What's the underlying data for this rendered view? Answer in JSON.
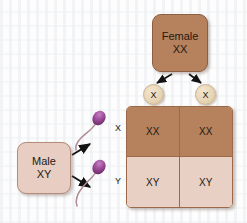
{
  "diagram": {
    "background_color": "#fdfdfd"
  },
  "female_parent": {
    "name": "Female parent box",
    "label": "Female",
    "genotype": "XX",
    "color": "#b6815d"
  },
  "male_parent": {
    "name": "Male parent box",
    "label": "Male",
    "genotype": "XY",
    "color": "#e7cdc2"
  },
  "female_gametes": [
    {
      "label": "X",
      "name": "egg-x-left"
    },
    {
      "label": "X",
      "name": "egg-x-right"
    }
  ],
  "male_gametes": [
    {
      "label": "X",
      "name": "sperm-x",
      "head_color": "#9b4a96"
    },
    {
      "label": "Y",
      "name": "sperm-y",
      "head_color": "#9b4a96"
    }
  ],
  "punnett": {
    "row_labels": [
      "X",
      "Y"
    ],
    "column_labels": [
      "X",
      "X"
    ],
    "cells": [
      {
        "text": "XX",
        "shade": "dark"
      },
      {
        "text": "XX",
        "shade": "dark"
      },
      {
        "text": "XY",
        "shade": "light"
      },
      {
        "text": "XY",
        "shade": "light"
      }
    ],
    "dark_color": "#b6815d",
    "light_color": "#e9d0c5",
    "border_color": "#9a6a4a"
  },
  "arrows": {
    "color": "#121212",
    "count": 4
  }
}
